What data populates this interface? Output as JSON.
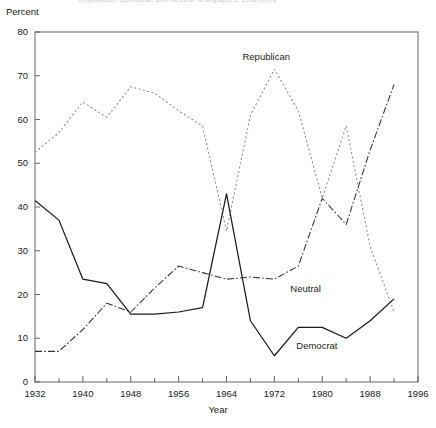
{
  "figure": {
    "cut_title": "Republican, Democrat, and Neutral Newspapers, 1932-1996",
    "ylabel": "Percent",
    "xlabel": "Year"
  },
  "axes": {
    "y_ticks": [
      0,
      10,
      20,
      30,
      40,
      50,
      60,
      70,
      80
    ],
    "x_ticks": [
      1932,
      1940,
      1948,
      1956,
      1964,
      1972,
      1980,
      1988,
      1996
    ],
    "x_minor_step": 4
  },
  "series_labels": {
    "republican": "Republican",
    "neutral": "Neutral",
    "democrat": "Democrat"
  },
  "colors": {
    "axis": "#555555",
    "republican": "#8a8a8a",
    "neutral": "#333333",
    "democrat": "#1a1a1a",
    "background": "#ffffff"
  },
  "chart_data": {
    "type": "line",
    "title": "Republican, Democrat, and Neutral Newspapers, 1932-1996",
    "xlabel": "Year",
    "ylabel": "Percent",
    "xlim": [
      1932,
      1996
    ],
    "ylim": [
      0,
      80
    ],
    "grid": false,
    "legend": "inline-annotations",
    "x": [
      1932,
      1936,
      1940,
      1944,
      1948,
      1952,
      1956,
      1960,
      1964,
      1968,
      1972,
      1976,
      1980,
      1984,
      1988,
      1992
    ],
    "series": [
      {
        "name": "Republican",
        "style": "dotted",
        "color": "#8a8a8a",
        "values": [
          52.5,
          57.0,
          64.0,
          60.5,
          67.5,
          66.0,
          62.0,
          58.5,
          34.5,
          61.0,
          71.5,
          62.0,
          42.0,
          58.5,
          31.0,
          16.0
        ]
      },
      {
        "name": "Neutral",
        "style": "dash-dot",
        "color": "#333333",
        "values": [
          7.0,
          7.0,
          12.0,
          18.0,
          16.0,
          21.5,
          26.5,
          25.0,
          23.5,
          24.0,
          23.5,
          26.5,
          42.0,
          36.0,
          53.0,
          68.0
        ]
      },
      {
        "name": "Democrat",
        "style": "solid",
        "color": "#1a1a1a",
        "values": [
          41.5,
          37.0,
          23.5,
          22.5,
          15.5,
          15.5,
          16.0,
          17.0,
          43.0,
          14.0,
          6.0,
          12.5,
          12.5,
          10.0,
          14.0,
          19.0
        ]
      }
    ],
    "annotations": [
      {
        "text": "Republican",
        "x": 1967,
        "y": 74
      },
      {
        "text": "Neutral",
        "x": 1975,
        "y": 21
      },
      {
        "text": "Democrat",
        "x": 1976,
        "y": 8
      }
    ]
  }
}
